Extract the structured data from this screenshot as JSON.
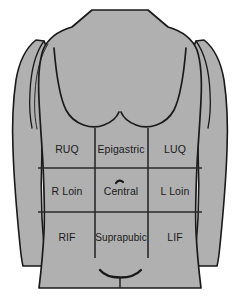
{
  "diagram": {
    "colors": {
      "background": "#ffffff",
      "body_fill": "#b0b0b0",
      "outline": "#1a1a1a",
      "grid_line": "#2a2a2a",
      "label_text": "#1a1a1a"
    }
  },
  "grid": {
    "columns": 3,
    "rows": 3,
    "vertical_lines_x": [
      95,
      148
    ],
    "horizontal_lines_y": [
      168,
      212
    ],
    "vertical_extent_y": [
      128,
      258
    ],
    "horizontal_extent_x": [
      38,
      200
    ]
  },
  "regions": [
    {
      "id": "ruq",
      "label": "RUQ",
      "row": 1,
      "col": 1,
      "cx": 67,
      "cy": 150
    },
    {
      "id": "epigastric",
      "label": "Epigastric",
      "row": 1,
      "col": 2,
      "cx": 121,
      "cy": 150
    },
    {
      "id": "luq",
      "label": "LUQ",
      "row": 1,
      "col": 3,
      "cx": 175,
      "cy": 150
    },
    {
      "id": "r-loin",
      "label": "R Loin",
      "row": 2,
      "col": 1,
      "cx": 67,
      "cy": 192
    },
    {
      "id": "central",
      "label": "Central",
      "row": 2,
      "col": 2,
      "cx": 121,
      "cy": 192
    },
    {
      "id": "l-loin",
      "label": "L Loin",
      "row": 2,
      "col": 3,
      "cx": 175,
      "cy": 192
    },
    {
      "id": "rif",
      "label": "RIF",
      "row": 3,
      "col": 1,
      "cx": 67,
      "cy": 238
    },
    {
      "id": "suprapubic",
      "label": "Suprapubic",
      "row": 3,
      "col": 2,
      "cx": 121,
      "cy": 238
    },
    {
      "id": "lif",
      "label": "LIF",
      "row": 3,
      "col": 3,
      "cx": 175,
      "cy": 238
    }
  ],
  "landmarks": [
    {
      "id": "umbilicus",
      "name": "umbilicus-mark",
      "x": 118,
      "y": 182
    },
    {
      "id": "pubic-arch",
      "name": "pubic-arch-curve",
      "x": 120,
      "y": 274
    },
    {
      "id": "costal-margin-left",
      "name": "costal-margin-left"
    },
    {
      "id": "costal-margin-right",
      "name": "costal-margin-right"
    }
  ]
}
